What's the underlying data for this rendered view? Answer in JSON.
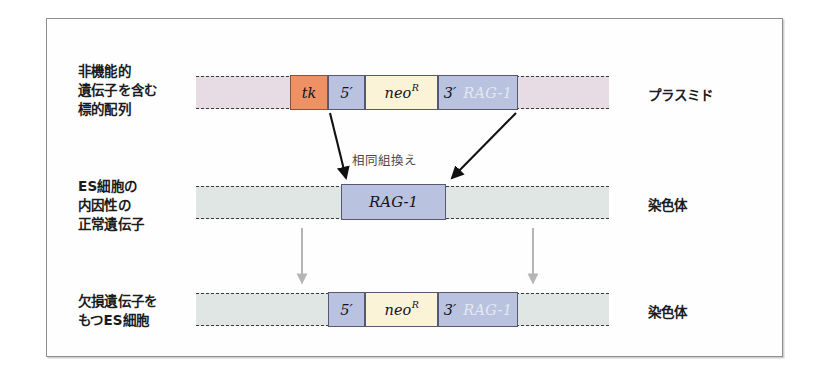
{
  "figure": {
    "title_alt": "Gene targeting in ES cells by homologous recombination",
    "annotation": "相同組換え"
  },
  "colors": {
    "frame_border": "#8d8d8d",
    "plasmid_backbone": "#e7dbe4",
    "chromosome_backbone": "#e0e6e4",
    "tk_box": "#ee9266",
    "homology_arm_box": "#b9c2de",
    "neo_box": "#fbf3d8",
    "box_border": "#55586e",
    "ghost_text": "#e4e8f3",
    "arrow_black": "#111111",
    "arrow_gray": "#b5b5b5"
  },
  "rows": [
    {
      "id": "targeting-construct",
      "left_label": "非機能的\n遺伝子を含む\n標的配列",
      "right_label": "プラスミド",
      "backbone_type": "plasmid",
      "segments": [
        {
          "id": "tk",
          "label": "tk",
          "ghost": "",
          "color": "#ee9266"
        },
        {
          "id": "five-prime-arm",
          "label": "5′",
          "ghost": "",
          "color": "#b9c2de"
        },
        {
          "id": "neo-resistance",
          "label": "neo",
          "superscript": "R",
          "ghost": "",
          "color": "#fbf3d8"
        },
        {
          "id": "three-prime-arm",
          "label": "3′",
          "ghost": "RAG-1",
          "color": "#b9c2de"
        }
      ]
    },
    {
      "id": "endogenous-gene",
      "left_label": "ES細胞の\n内因性の\n正常遺伝子",
      "right_label": "染色体",
      "backbone_type": "chromosome",
      "segments": [
        {
          "id": "rag1-gene",
          "label": "RAG-1",
          "ghost": "",
          "color": "#b9c2de"
        }
      ]
    },
    {
      "id": "targeted-allele",
      "left_label": "欠損遺伝子を\nもつES細胞",
      "right_label": "染色体",
      "backbone_type": "chromosome",
      "segments": [
        {
          "id": "five-prime-arm",
          "label": "5′",
          "ghost": "",
          "color": "#b9c2de"
        },
        {
          "id": "neo-resistance",
          "label": "neo",
          "superscript": "R",
          "ghost": "",
          "color": "#fbf3d8"
        },
        {
          "id": "three-prime-arm",
          "label": "3′",
          "ghost": "RAG-1",
          "color": "#b9c2de"
        }
      ]
    }
  ]
}
